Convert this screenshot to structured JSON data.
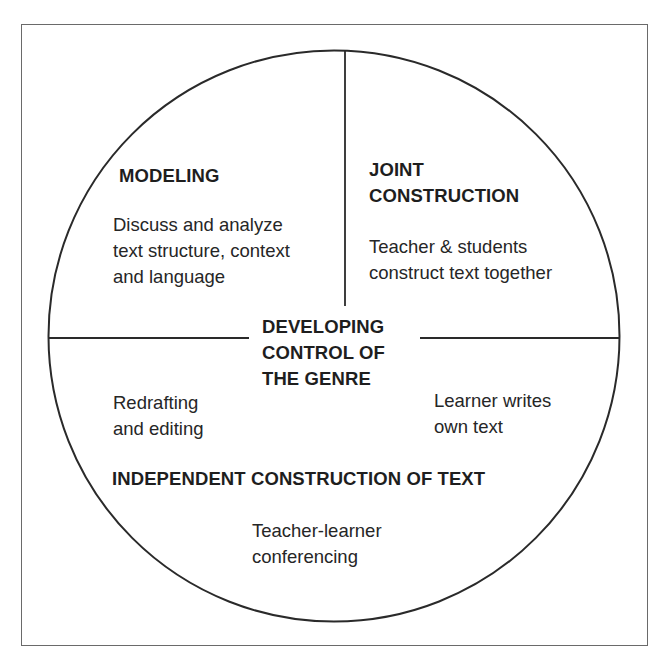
{
  "diagram": {
    "type": "teaching-learning-cycle",
    "center": {
      "lines": [
        "DEVELOPING",
        "CONTROL OF",
        "THE GENRE"
      ]
    },
    "sections": [
      {
        "id": "modeling",
        "position": "top-left",
        "title_lines": [
          "MODELING"
        ],
        "description_lines": [
          "Discuss and analyze",
          "text structure, context",
          "and language"
        ]
      },
      {
        "id": "joint-construction",
        "position": "top-right",
        "title_lines": [
          "JOINT",
          "CONSTRUCTION"
        ],
        "description_lines": [
          "Teacher & students",
          "construct text together"
        ]
      },
      {
        "id": "independent-construction",
        "position": "bottom",
        "title_lines": [
          "INDEPENDENT CONSTRUCTION OF TEXT"
        ],
        "notes": [
          {
            "id": "redrafting",
            "position": "left",
            "lines": [
              "Redrafting",
              "and editing"
            ]
          },
          {
            "id": "learner-writes",
            "position": "right",
            "lines": [
              "Learner writes",
              "own text"
            ]
          },
          {
            "id": "conferencing",
            "position": "bottom",
            "lines": [
              "Teacher-learner",
              "conferencing"
            ]
          }
        ]
      }
    ],
    "colors": {
      "stroke": "#2a2a2a",
      "frame": "#6a6a6a",
      "text": "#1e1e1e",
      "background": "#ffffff"
    }
  }
}
